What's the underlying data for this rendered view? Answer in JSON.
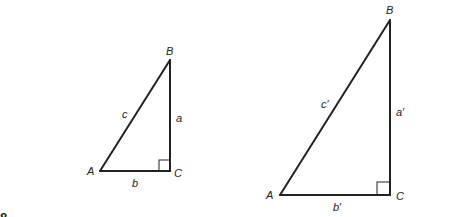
{
  "figure_number": "8",
  "triangle_small": {
    "vertices": {
      "A": "A",
      "B": "B",
      "C": "C"
    },
    "sides": {
      "a": "a",
      "b": "b",
      "c": "c"
    },
    "right_angle_at": "C"
  },
  "triangle_large": {
    "vertices": {
      "A": "A",
      "B": "B",
      "C": "C"
    },
    "sides": {
      "a": "a′",
      "b": "b′",
      "c": "c′"
    },
    "right_angle_at": "C"
  }
}
